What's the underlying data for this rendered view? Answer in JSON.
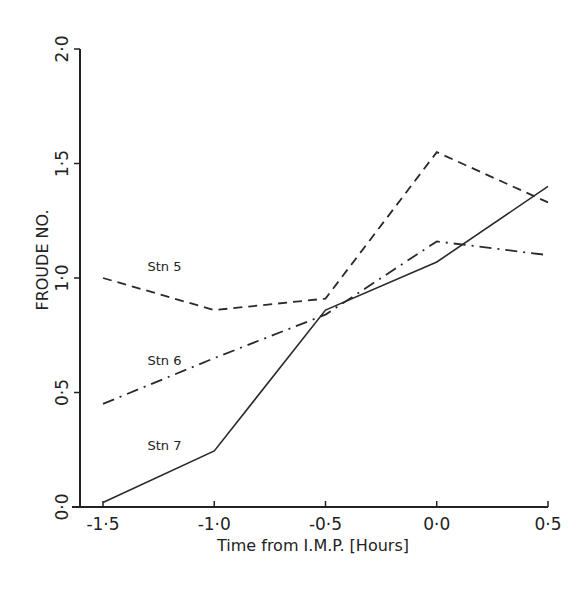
{
  "chart_data": {
    "type": "line",
    "title": "",
    "xlabel": "Time from I.M.P. [Hours]",
    "ylabel": "FROUDE NO.",
    "xlim": [
      -1.5,
      0.5
    ],
    "ylim": [
      0.0,
      2.0
    ],
    "grid": false,
    "legend_position": "inline labels",
    "x": [
      -1.5,
      -1.0,
      -0.5,
      0.0,
      0.5
    ],
    "x_tick_labels": [
      "-1·5",
      "-1·0",
      "-0·5",
      "0·0",
      "0·5"
    ],
    "y_ticks": [
      0.0,
      0.5,
      1.0,
      1.5,
      2.0
    ],
    "y_tick_labels": [
      "0·0",
      "0·5",
      "1·0",
      "1·5",
      "2·0"
    ],
    "series": [
      {
        "name": "Stn 5",
        "style": "dashed",
        "values": [
          1.0,
          0.86,
          0.91,
          1.55,
          1.33
        ]
      },
      {
        "name": "Stn 6",
        "style": "dash-dot",
        "values": [
          0.45,
          0.65,
          0.84,
          1.16,
          1.1
        ]
      },
      {
        "name": "Stn 7",
        "style": "solid",
        "values": [
          0.02,
          0.245,
          0.86,
          1.07,
          1.4
        ]
      }
    ],
    "annotations": [
      {
        "text": "Stn 5",
        "x": -1.3,
        "y": 1.03
      },
      {
        "text": "Stn 6",
        "x": -1.3,
        "y": 0.62
      },
      {
        "text": "Stn 7",
        "x": -1.3,
        "y": 0.25
      }
    ]
  }
}
